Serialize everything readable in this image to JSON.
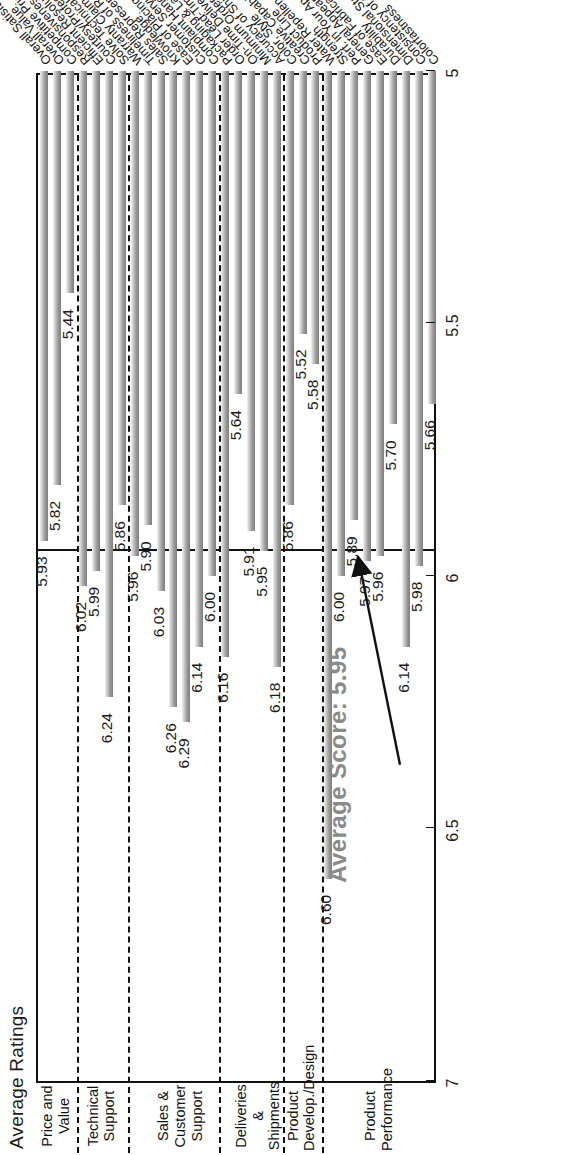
{
  "chart_data": {
    "type": "bar",
    "orientation": "horizontal",
    "title": "Average Ratings",
    "xlabel": "",
    "ylabel": "",
    "ylim": [
      5,
      7
    ],
    "yticks": [
      "7",
      "6.5",
      "6",
      "5.5",
      "5"
    ],
    "grid": false,
    "legend": null,
    "annotation": "Average Score: 5.95",
    "reference_line": 5.95,
    "sections": [
      {
        "name": "Product Performance",
        "categories": [
          "Colorfastness",
          "Consistency of Quality",
          "Dimensional Stability",
          "Durability",
          "Ease of Fabrication",
          "General Appearance",
          "Perf. in Your Application",
          "Strength",
          "Water Repellency",
          "Product Line"
        ],
        "values": [
          5.66,
          5.98,
          6.14,
          5.7,
          5.96,
          5.97,
          5.89,
          6.0,
          6.6,
          6.6
        ]
      },
      {
        "name": "Product Develop./Design",
        "categories": [
          "Creative Capability",
          "Color, Style",
          "Accuracy of Shipments"
        ],
        "values": [
          5.58,
          5.52,
          5.86
        ]
      },
      {
        "name": "Deliveries & Shipments",
        "categories": [
          "Minimum Order Size",
          "On-Time Deliveries",
          "Order Lead-Times",
          "Packaging & Labeling",
          "Complaint Handling"
        ],
        "values": [
          6.18,
          5.95,
          5.91,
          5.64,
          6.16
        ]
      },
      {
        "name": "Sales & Customer Support",
        "categories": [
          "Customer Service",
          "Ease of Placing an Order",
          "Knowledge",
          "Sales Representation",
          "Timeliness of Response",
          "Warranty Claim Handling",
          "Solve Technical Problems"
        ],
        "values": [
          6.0,
          6.14,
          6.29,
          6.26,
          6.03,
          5.9,
          5.96
        ]
      },
      {
        "name": "Technical Support",
        "categories": [
          "Courtesy/Professionalism",
          "Efficient Resolution",
          "Responsiveness",
          "Competitive Price"
        ],
        "values": [
          5.86,
          6.24,
          5.99,
          6.02
        ]
      },
      {
        "name": "Price and Value",
        "categories": [
          "Overall Value",
          "Overall Satisfaction"
        ],
        "values": [
          5.44,
          5.82
        ]
      }
    ],
    "bars": [
      {
        "label": "Colorfastness",
        "value": 5.66,
        "section": "Product Performance"
      },
      {
        "label": "Consistency of Quality",
        "value": 5.98,
        "section": "Product Performance"
      },
      {
        "label": "Dimensional Stability",
        "value": 6.14,
        "section": "Product Performance"
      },
      {
        "label": "Durability",
        "value": 5.7,
        "section": "Product Performance"
      },
      {
        "label": "Ease of Fabrication",
        "value": 5.96,
        "section": "Product Performance"
      },
      {
        "label": "General Appearance",
        "value": 5.97,
        "section": "Product Performance"
      },
      {
        "label": "Perf. in Your Application",
        "value": 5.89,
        "section": "Product Performance"
      },
      {
        "label": "Strength",
        "value": 6.0,
        "section": "Product Performance"
      },
      {
        "label": "Water Repellency",
        "value": 6.6,
        "section": "Product Performance"
      },
      {
        "label": "Product Line",
        "value": 5.58,
        "section": "Product Develop./Design"
      },
      {
        "label": "Creative Capability",
        "value": 5.52,
        "section": "Product Develop./Design"
      },
      {
        "label": "Color, Style",
        "value": 5.86,
        "section": "Product Develop./Design"
      },
      {
        "label": "Accuracy of Shipments",
        "value": 6.18,
        "section": "Deliveries & Shipments"
      },
      {
        "label": "Minimum Order Size",
        "value": 5.95,
        "section": "Deliveries & Shipments"
      },
      {
        "label": "On-Time Deliveries",
        "value": 5.91,
        "section": "Deliveries & Shipments"
      },
      {
        "label": "Order Lead-Times",
        "value": 5.64,
        "section": "Deliveries & Shipments"
      },
      {
        "label": "Packaging & Labeling",
        "value": 6.16,
        "section": "Deliveries & Shipments"
      },
      {
        "label": "Complaint Handling",
        "value": 6.0,
        "section": "Sales & Customer Support"
      },
      {
        "label": "Customer Service",
        "value": 6.14,
        "section": "Sales & Customer Support"
      },
      {
        "label": "Ease of Placing an Order",
        "value": 6.29,
        "section": "Sales & Customer Support"
      },
      {
        "label": "Knowledge",
        "value": 6.26,
        "section": "Sales & Customer Support"
      },
      {
        "label": "Sales Representation",
        "value": 6.03,
        "section": "Sales & Customer Support"
      },
      {
        "label": "Timeliness of Response",
        "value": 5.9,
        "section": "Sales & Customer Support"
      },
      {
        "label": "Warranty Claim Handling",
        "value": 5.96,
        "section": "Sales & Customer Support"
      },
      {
        "label": "Solve Technical Problems",
        "value": 5.86,
        "section": "Technical Support"
      },
      {
        "label": "Courtesy/Professionalism",
        "value": 6.24,
        "section": "Technical Support"
      },
      {
        "label": "Efficient Resolution",
        "value": 5.99,
        "section": "Technical Support"
      },
      {
        "label": "Responsiveness",
        "value": 6.02,
        "section": "Technical Support"
      },
      {
        "label": "Competitive Price",
        "value": 5.44,
        "section": "Price and Value"
      },
      {
        "label": "Overall Value",
        "value": 5.82,
        "section": "Price and Value"
      },
      {
        "label": "Overall Satisfaction",
        "value": 5.93,
        "section": "Price and Value"
      }
    ],
    "section_breaks_after": [
      8,
      11,
      16,
      23,
      27
    ]
  }
}
